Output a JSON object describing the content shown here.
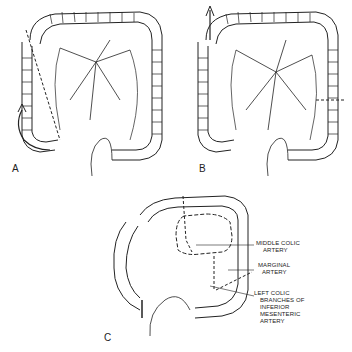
{
  "figure": {
    "panels": [
      {
        "id": "A",
        "label": "A"
      },
      {
        "id": "B",
        "label": "B"
      },
      {
        "id": "C",
        "label": "C"
      }
    ],
    "callouts": [
      {
        "id": "middle-colic",
        "lines": [
          "MIDDLE COLIC",
          "ARTERY"
        ]
      },
      {
        "id": "marginal",
        "lines": [
          "MARGINAL",
          "ARTERY"
        ]
      },
      {
        "id": "left-colic",
        "lines": [
          "LEFT COLIC",
          "BRANCHES OF",
          "INFERIOR",
          "MESENTERIC",
          "ARTERY"
        ]
      }
    ],
    "colors": {
      "ink": "#222222",
      "background": "#ffffff"
    }
  }
}
